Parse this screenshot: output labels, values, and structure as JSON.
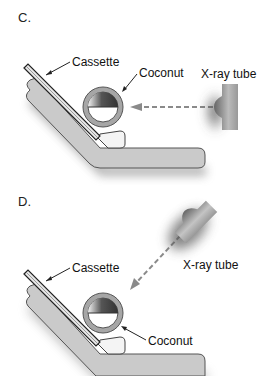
{
  "panels": [
    {
      "id": "C",
      "letter": "C.",
      "labels": {
        "cassette": "Cassette",
        "coconut": "Coconut",
        "xray_tube": "X-ray tube"
      },
      "beam_direction": "horizontal"
    },
    {
      "id": "D",
      "letter": "D.",
      "labels": {
        "cassette": "Cassette",
        "coconut": "Coconut",
        "xray_tube": "X-ray tube"
      },
      "beam_direction": "angled"
    }
  ],
  "colors": {
    "support": "#c9c9c9",
    "support_edge": "#555555",
    "coconut_shell": "#9a9a9a",
    "beam": "#8a8a8a",
    "tube": "#8c8c8c"
  }
}
